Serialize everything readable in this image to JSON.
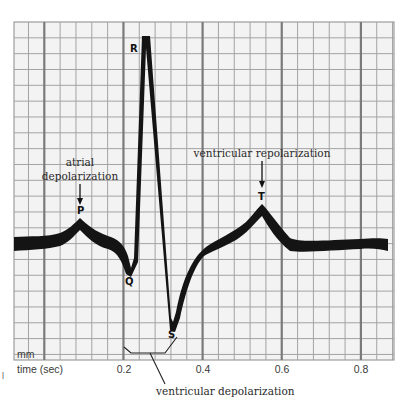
{
  "figure": {
    "type": "ecg-diagram",
    "colors": {
      "background": "#ffffff",
      "grid_fill": "#f3f3f3",
      "grid_minor": "#9a9a9a",
      "grid_major": "#7d7d7d",
      "trace": "#111111",
      "text": "#2a2a2a"
    }
  },
  "waves": {
    "P": "P",
    "Q": "Q",
    "R": "R",
    "S": "S",
    "T": "T"
  },
  "annotations": {
    "atrial_line1": "atrial",
    "atrial_line2": "depolarization",
    "ventricular_repolarization": "ventricular repolarization",
    "ventricular_depolarization": "ventricular depolarization"
  },
  "axis": {
    "unit_label": "mm",
    "x_label": "time (sec)",
    "ticks": [
      "0.2",
      "0.4",
      "0.6",
      "0.8"
    ]
  },
  "stray_mark": "l",
  "chart_data": {
    "type": "line",
    "title": "",
    "xlabel": "time (sec)",
    "ylabel": "mm",
    "x_ticks": [
      0.2,
      0.4,
      0.6,
      0.8
    ],
    "xlim": [
      -0.075,
      0.88
    ],
    "grid": true,
    "series": [
      {
        "name": "ECG trace",
        "points": [
          {
            "t": -0.075,
            "label": "baseline"
          },
          {
            "t": 0.09,
            "label": "P (peak)"
          },
          {
            "t": 0.21,
            "label": "Q (dip)"
          },
          {
            "t": 0.25,
            "label": "R (peak)"
          },
          {
            "t": 0.32,
            "label": "S (trough)"
          },
          {
            "t": 0.55,
            "label": "T (peak)"
          },
          {
            "t": 0.87,
            "label": "baseline"
          }
        ]
      }
    ],
    "annotations": [
      {
        "text": "atrial depolarization",
        "points_to": "P"
      },
      {
        "text": "ventricular repolarization",
        "points_to": "T"
      },
      {
        "text": "ventricular depolarization",
        "spans": "QRS complex"
      }
    ]
  }
}
